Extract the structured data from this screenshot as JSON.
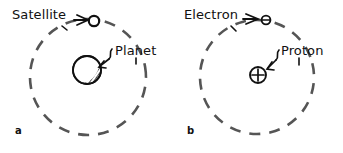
{
  "figure": {
    "type": "scientific-diagram",
    "ink_color": "#111111",
    "orbit_color": "#555555",
    "background_color": "#ffffff"
  },
  "panels": [
    {
      "id": "a",
      "letter": "a",
      "labels": {
        "orbiting_body": "Satellite",
        "central_body": "Planet"
      },
      "orbit": {
        "center_x": 88,
        "center_y": 77,
        "radius": 58,
        "style": "dashed"
      },
      "central_body": {
        "name": "planet-circle",
        "center_x": 87,
        "center_y": 70,
        "radius": 14,
        "shading": "crescent-shadow-lower-right"
      },
      "orbiting_body": {
        "name": "satellite-circle",
        "center_x": 94,
        "center_y": 21,
        "radius": 5
      }
    },
    {
      "id": "b",
      "letter": "b",
      "labels": {
        "orbiting_body": "Electron",
        "central_body": "Proton"
      },
      "orbit": {
        "center_x": 86,
        "center_y": 77,
        "radius": 57,
        "style": "dashed"
      },
      "central_body": {
        "name": "proton-circle",
        "center_x": 87,
        "center_y": 75,
        "radius": 8,
        "symbol": "+"
      },
      "orbiting_body": {
        "name": "electron-circle",
        "center_x": 95,
        "center_y": 20,
        "radius": 4,
        "symbol": "-"
      }
    }
  ]
}
